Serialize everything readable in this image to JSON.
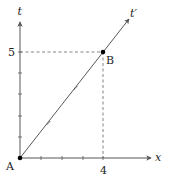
{
  "diagram": {
    "type": "spacetime-diagram",
    "axes": {
      "x": {
        "label": "x",
        "tick_count": 4,
        "marked_value": "4"
      },
      "t": {
        "label": "t",
        "tick_count": 5,
        "marked_value": "5"
      },
      "t_prime": {
        "label": "t′"
      }
    },
    "points": [
      {
        "id": "A",
        "label": "A",
        "x": 0,
        "t": 0
      },
      {
        "id": "B",
        "label": "B",
        "x": 4,
        "t": 5
      }
    ],
    "guides": {
      "dashed_to_axes_from": "B"
    },
    "colors": {
      "stroke": "#333333",
      "dashed": "#555555",
      "point": "#000000"
    }
  }
}
